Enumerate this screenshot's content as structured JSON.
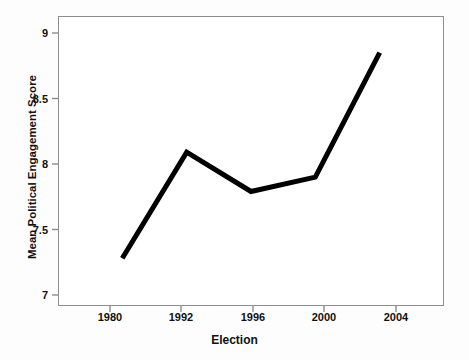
{
  "chart_data": {
    "type": "line",
    "title": "",
    "subtitle": "",
    "xlabel": "Election",
    "ylabel": "Mean Political Engagement Score",
    "categories": [
      "1980",
      "1992",
      "1996",
      "2000",
      "2004"
    ],
    "values": [
      7.28,
      8.09,
      7.79,
      7.9,
      8.85
    ],
    "series": [
      {
        "name": "Mean Political Engagement Score",
        "values": [
          7.28,
          8.09,
          7.79,
          7.9,
          8.85
        ]
      }
    ],
    "ylim": [
      6.85,
      9.05
    ],
    "yticks": [
      "7",
      "7.5",
      "8",
      "8.5",
      "9"
    ],
    "ytick_values": [
      7,
      7.5,
      8,
      8.5,
      9
    ],
    "xtick_labels": [
      "1980",
      "1992",
      "1996",
      "2000",
      "2004"
    ],
    "grid": false,
    "legend": false,
    "legend_position": "none",
    "line_color": "#000000",
    "line_width": 5,
    "frame_color": "#8d8d8d",
    "plot_background": "#ffffff",
    "figure_background": "#fdfdfd",
    "markers": false
  }
}
